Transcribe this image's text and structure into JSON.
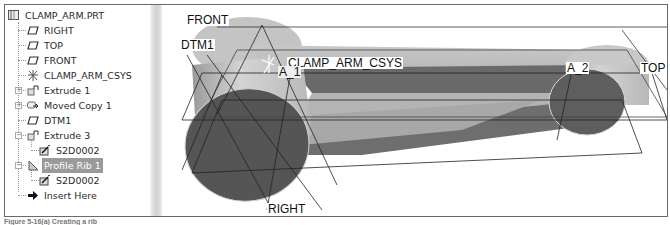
{
  "model_tree": {
    "root": {
      "label": "CLAMP_ARM.PRT",
      "icon": "part-icon"
    },
    "items": [
      {
        "label": "RIGHT",
        "icon": "datum-plane-icon",
        "expandable": false,
        "indent": 1
      },
      {
        "label": "TOP",
        "icon": "datum-plane-icon",
        "expandable": false,
        "indent": 1
      },
      {
        "label": "FRONT",
        "icon": "datum-plane-icon",
        "expandable": false,
        "indent": 1
      },
      {
        "label": "CLAMP_ARM_CSYS",
        "icon": "csys-icon",
        "expandable": false,
        "indent": 1
      },
      {
        "label": "Extrude 1",
        "icon": "extrude-icon",
        "expandable": true,
        "expander": "+",
        "indent": 1
      },
      {
        "label": "Moved Copy 1",
        "icon": "moved-copy-icon",
        "expandable": true,
        "expander": "+",
        "indent": 1
      },
      {
        "label": "DTM1",
        "icon": "datum-plane-icon",
        "expandable": false,
        "indent": 1
      },
      {
        "label": "Extrude 3",
        "icon": "extrude-icon",
        "expandable": true,
        "expander": "−",
        "indent": 1
      },
      {
        "label": "S2D0002",
        "icon": "sketch-icon",
        "expandable": false,
        "indent": 2
      },
      {
        "label": "Profile Rib 1",
        "icon": "rib-icon",
        "expandable": true,
        "expander": "−",
        "indent": 1,
        "selected": true
      },
      {
        "label": "S2D0002",
        "icon": "sketch-icon",
        "expandable": false,
        "indent": 2
      },
      {
        "label": "Insert Here",
        "icon": "insert-arrow-icon",
        "expandable": false,
        "indent": 1
      }
    ]
  },
  "viewport": {
    "labels": {
      "front": "FRONT",
      "dtm1": "DTM1",
      "csys": "CLAMP_ARM_CSYS",
      "axis1": "A_1",
      "axis2": "A_2",
      "top": "TOP",
      "right": "RIGHT"
    },
    "colors": {
      "boss_side": "#c8c8c8",
      "boss_face": "#5a5a5a",
      "arm_top": "#bdbdbd",
      "arm_side": "#6e6e6e",
      "rib": "#7a7a7a"
    }
  },
  "caption": "Figure 5-16(a) Creating a rib"
}
